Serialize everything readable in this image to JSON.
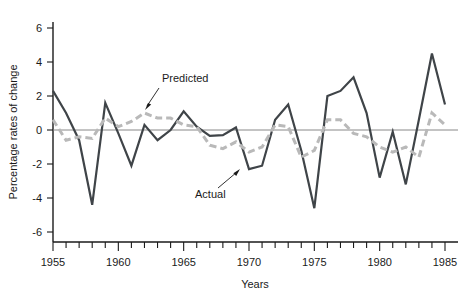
{
  "chart_data": {
    "type": "line",
    "title": "",
    "xlabel": "Years",
    "ylabel": "Percentage rates of change",
    "xlim": [
      1955,
      1985
    ],
    "ylim": [
      -6,
      6
    ],
    "grid": false,
    "legend_position": "inline-annotation",
    "x_tick_labels": [
      "1955",
      "1960",
      "1965",
      "1970",
      "1975",
      "1980",
      "1985"
    ],
    "x_tick_values": [
      1955,
      1960,
      1965,
      1970,
      1975,
      1980,
      1985
    ],
    "x_minor_tick_interval": 1,
    "y_tick_labels": [
      "6",
      "4",
      "2",
      "0",
      "-2",
      "-4",
      "-6"
    ],
    "y_tick_values": [
      6,
      4,
      2,
      0,
      -2,
      -4,
      -6
    ],
    "x": [
      1955,
      1956,
      1957,
      1958,
      1959,
      1960,
      1961,
      1962,
      1963,
      1964,
      1965,
      1966,
      1967,
      1968,
      1969,
      1970,
      1971,
      1972,
      1973,
      1974,
      1975,
      1976,
      1977,
      1978,
      1979,
      1980,
      1981,
      1982,
      1983,
      1984,
      1985
    ],
    "series": [
      {
        "name": "Actual",
        "style": "solid",
        "color": "#3f4448",
        "values": [
          2.3,
          1.0,
          -0.6,
          -4.4,
          1.6,
          -0.2,
          -2.1,
          0.3,
          -0.6,
          0.0,
          1.1,
          0.2,
          -0.35,
          -0.3,
          0.15,
          -2.3,
          -2.1,
          0.6,
          1.5,
          -1.2,
          -4.6,
          2.0,
          2.3,
          3.1,
          1.0,
          -2.8,
          -0.1,
          -3.2,
          0.6,
          4.5,
          1.5
        ]
      },
      {
        "name": "Predicted",
        "style": "dashed",
        "color": "#b9b9b9",
        "values": [
          0.6,
          -0.6,
          -0.4,
          -0.5,
          0.7,
          0.2,
          0.5,
          1.0,
          0.7,
          0.7,
          0.3,
          0.2,
          -0.9,
          -1.1,
          -0.7,
          -1.3,
          -1.0,
          0.3,
          0.2,
          -1.6,
          -1.2,
          0.6,
          0.6,
          -0.2,
          -0.4,
          -1.0,
          -1.3,
          -1.0,
          -1.6,
          1.0,
          0.3
        ]
      }
    ],
    "annotations": [
      {
        "text": "Predicted",
        "target_series": "Predicted",
        "target_year": 1962
      },
      {
        "text": "Actual",
        "target_series": "Actual",
        "target_year": 1970
      }
    ]
  }
}
